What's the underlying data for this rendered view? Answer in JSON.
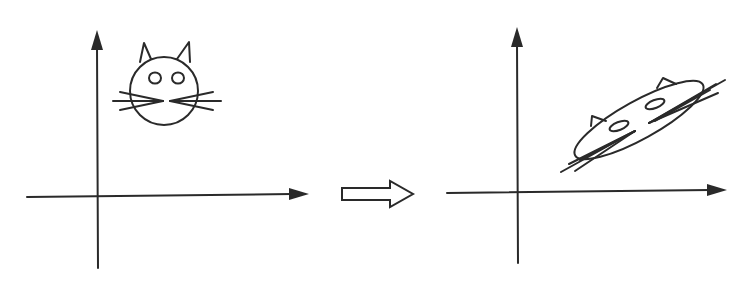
{
  "diagram": {
    "colors": {
      "ink": "#2a2a2a",
      "background": "#ffffff"
    },
    "panels": [
      {
        "id": "original",
        "figure": "cat-face",
        "shape": "circle"
      },
      {
        "id": "transformed",
        "figure": "cat-face",
        "shape": "stretched-ellipse"
      }
    ],
    "connector": {
      "type": "hollow-arrow",
      "direction": "right"
    }
  }
}
